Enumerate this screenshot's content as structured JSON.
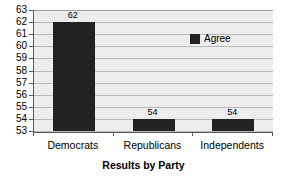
{
  "chart_data": {
    "type": "bar",
    "title": "",
    "categories": [
      "Democrats",
      "Republicans",
      "Independents"
    ],
    "values": [
      62,
      54,
      54
    ],
    "data_labels": [
      "62",
      "54",
      "54"
    ],
    "series": [
      {
        "name": "Agree",
        "values": [
          62,
          54,
          54
        ],
        "color": "#222222"
      }
    ],
    "xlabel": "Results by Party",
    "ylabel": "",
    "ylim": [
      53,
      63
    ],
    "ytick_step": 1,
    "ytick_labels": [
      "63",
      "62",
      "61",
      "60",
      "59",
      "58",
      "57",
      "56",
      "55",
      "54",
      "53"
    ],
    "grid": true,
    "legend_position": "inside-top-right",
    "plot_background": "#ededed",
    "axis_color": "#5a5a5a",
    "gridline_color": "#b9b9b9"
  },
  "legend": {
    "entries": [
      {
        "label": "Agree",
        "swatch_color": "#222222"
      }
    ]
  }
}
